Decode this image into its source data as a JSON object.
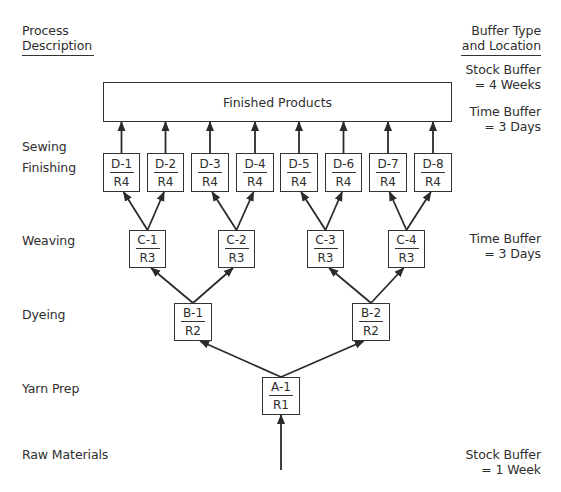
{
  "header": {
    "left_title_line1": "Process",
    "left_title_line2": "Description",
    "right_title_line1": "Buffer Type",
    "right_title_line2": "and Location"
  },
  "stages": [
    {
      "label": "Sewing",
      "y": 147
    },
    {
      "label": "Finishing",
      "y": 168
    },
    {
      "label": "Weaving",
      "y": 241
    },
    {
      "label": "Dyeing",
      "y": 315
    },
    {
      "label": "Yarn Prep",
      "y": 389
    },
    {
      "label": "Raw Materials",
      "y": 455
    }
  ],
  "buffers": [
    {
      "line1": "Stock Buffer",
      "line2": "= 4 Weeks",
      "y": 62
    },
    {
      "line1": "Time Buffer",
      "line2": "= 3 Days",
      "y": 104
    },
    {
      "line1": "Time Buffer",
      "line2": "= 3 Days",
      "y": 231
    },
    {
      "line1": "Stock Buffer",
      "line2": "= 1 Week",
      "y": 447
    }
  ],
  "finished_products": {
    "label": "Finished Products",
    "x": 103,
    "y": 82,
    "w": 349,
    "h": 40
  },
  "nodes": [
    {
      "id": "D-1",
      "resource": "R4",
      "x": 103,
      "y": 153,
      "w": 37,
      "h": 39
    },
    {
      "id": "D-2",
      "resource": "R4",
      "x": 147,
      "y": 153,
      "w": 37,
      "h": 39
    },
    {
      "id": "D-3",
      "resource": "R4",
      "x": 191,
      "y": 153,
      "w": 38,
      "h": 39
    },
    {
      "id": "D-4",
      "resource": "R4",
      "x": 236,
      "y": 153,
      "w": 38,
      "h": 39
    },
    {
      "id": "D-5",
      "resource": "R4",
      "x": 280,
      "y": 153,
      "w": 38,
      "h": 39
    },
    {
      "id": "D-6",
      "resource": "R4",
      "x": 325,
      "y": 153,
      "w": 37,
      "h": 39
    },
    {
      "id": "D-7",
      "resource": "R4",
      "x": 369,
      "y": 153,
      "w": 38,
      "h": 39
    },
    {
      "id": "D-8",
      "resource": "R4",
      "x": 414,
      "y": 153,
      "w": 38,
      "h": 39
    },
    {
      "id": "C-1",
      "resource": "R3",
      "x": 129,
      "y": 230,
      "w": 37,
      "h": 38
    },
    {
      "id": "C-2",
      "resource": "R3",
      "x": 218,
      "y": 230,
      "w": 37,
      "h": 38
    },
    {
      "id": "C-3",
      "resource": "R3",
      "x": 307,
      "y": 230,
      "w": 37,
      "h": 38
    },
    {
      "id": "C-4",
      "resource": "R3",
      "x": 388,
      "y": 230,
      "w": 37,
      "h": 38
    },
    {
      "id": "B-1",
      "resource": "R2",
      "x": 174,
      "y": 303,
      "w": 38,
      "h": 38
    },
    {
      "id": "B-2",
      "resource": "R2",
      "x": 352,
      "y": 303,
      "w": 38,
      "h": 38
    },
    {
      "id": "A-1",
      "resource": "R1",
      "x": 262,
      "y": 377,
      "w": 38,
      "h": 38
    }
  ],
  "edges": [
    {
      "from": "RAW",
      "to": "A-1"
    },
    {
      "from": "A-1",
      "to": "B-1"
    },
    {
      "from": "A-1",
      "to": "B-2"
    },
    {
      "from": "B-1",
      "to": "C-1"
    },
    {
      "from": "B-1",
      "to": "C-2"
    },
    {
      "from": "B-2",
      "to": "C-3"
    },
    {
      "from": "B-2",
      "to": "C-4"
    },
    {
      "from": "C-1",
      "to": "D-1"
    },
    {
      "from": "C-1",
      "to": "D-2"
    },
    {
      "from": "C-2",
      "to": "D-3"
    },
    {
      "from": "C-2",
      "to": "D-4"
    },
    {
      "from": "C-3",
      "to": "D-5"
    },
    {
      "from": "C-3",
      "to": "D-6"
    },
    {
      "from": "C-4",
      "to": "D-7"
    },
    {
      "from": "C-4",
      "to": "D-8"
    },
    {
      "from": "D-1",
      "to": "FP"
    },
    {
      "from": "D-2",
      "to": "FP"
    },
    {
      "from": "D-3",
      "to": "FP"
    },
    {
      "from": "D-4",
      "to": "FP"
    },
    {
      "from": "D-5",
      "to": "FP"
    },
    {
      "from": "D-6",
      "to": "FP"
    },
    {
      "from": "D-7",
      "to": "FP"
    },
    {
      "from": "D-8",
      "to": "FP"
    }
  ],
  "raw_input": {
    "x": 281,
    "y_start": 470
  },
  "colors": {
    "line": "#2b2b2b",
    "text": "#2e2e2e",
    "background": "#ffffff"
  }
}
